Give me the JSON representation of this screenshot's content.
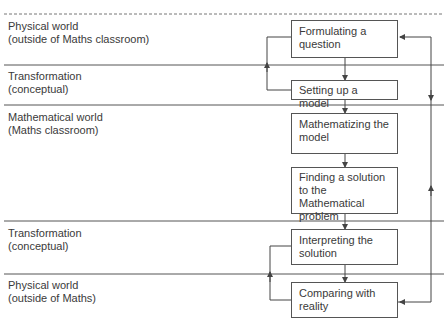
{
  "zones": [
    {
      "line1": "Physical world",
      "line2": "(outside of Maths classroom)"
    },
    {
      "line1": "Transformation",
      "line2": "(conceptual)"
    },
    {
      "line1": "Mathematical world",
      "line2": "(Maths classroom)"
    },
    {
      "line1": "Transformation",
      "line2": "(conceptual)"
    },
    {
      "line1": "Physical world",
      "line2": "(outside of Maths)"
    }
  ],
  "steps": [
    {
      "line1": "Formulating a",
      "line2": "question",
      "line3": ""
    },
    {
      "line1": "Setting up a model",
      "line2": "",
      "line3": ""
    },
    {
      "line1": "Mathematizing the",
      "line2": "model",
      "line3": ""
    },
    {
      "line1": "Finding a solution",
      "line2": "to the Mathematical",
      "line3": "problem"
    },
    {
      "line1": "Interpreting the",
      "line2": "solution",
      "line3": ""
    },
    {
      "line1": "Comparing with",
      "line2": "reality",
      "line3": ""
    }
  ],
  "colors": {
    "line": "#555555",
    "text": "#3a3a3a"
  }
}
